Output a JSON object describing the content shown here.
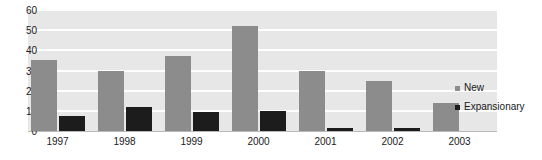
{
  "chart_data": {
    "type": "bar",
    "title": "",
    "xlabel": "",
    "ylabel": "",
    "ylim": [
      0,
      60
    ],
    "yticks": [
      0,
      10,
      20,
      30,
      40,
      50,
      60
    ],
    "grid": true,
    "legend_position": "right",
    "categories": [
      "1997",
      "1998",
      "1999",
      "2000",
      "2001",
      "2002",
      "2003"
    ],
    "series": [
      {
        "name": "New",
        "color": "#8c8c8c",
        "values": [
          35,
          30,
          37,
          52,
          30,
          25,
          14
        ]
      },
      {
        "name": "Expansionary",
        "color": "#1c1c1c",
        "values": [
          7.5,
          12,
          9.5,
          10,
          1.5,
          1.5,
          0
        ]
      }
    ]
  },
  "legend": {
    "items": [
      {
        "label": "New",
        "marker": "square-marker-gray"
      },
      {
        "label": "Expansionary",
        "marker": "square-marker-black"
      }
    ]
  },
  "plot": {
    "background_color": "#e7e7e7",
    "gridline_color": "#ffffff",
    "axis_color": "#b9b9b9"
  }
}
